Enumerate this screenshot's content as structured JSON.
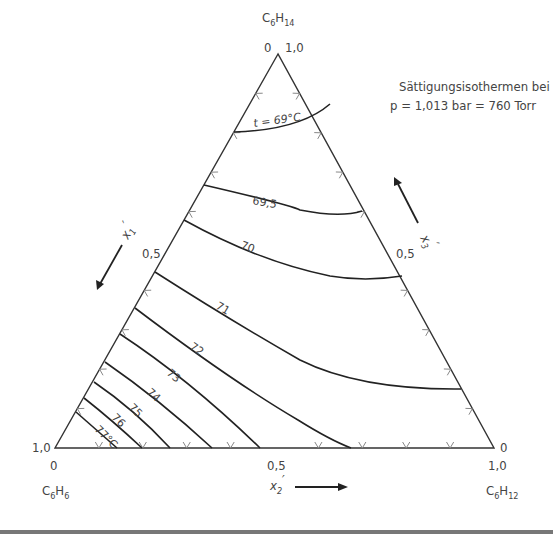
{
  "title": {
    "line1": "Sättigungsisothermen bei",
    "line2": "p = 1,013 bar = 760 Torr"
  },
  "components": {
    "top": {
      "base": "C",
      "sub1": "6",
      "mid": "H",
      "sub2": "14"
    },
    "left": {
      "base": "C",
      "sub1": "6",
      "mid": "H",
      "sub2": "6"
    },
    "right": {
      "base": "C",
      "sub1": "6",
      "mid": "H",
      "sub2": "12"
    }
  },
  "axes": {
    "x1": {
      "label": "x",
      "sub": "1",
      "prime": "′",
      "mid_tick": "0,5",
      "start": "0",
      "end": "1,0"
    },
    "x2": {
      "label": "x",
      "sub": "2",
      "prime": "′",
      "mid_tick": "0,5",
      "start": "0",
      "end": "1,0"
    },
    "x3": {
      "label": "x",
      "sub": "3",
      "prime": "′",
      "mid_tick": "0,5",
      "start": "0",
      "end": "1,0"
    }
  },
  "vertex_labels": {
    "top_left": "0",
    "top_right": "1,0",
    "bottom_left_side": "1,0",
    "bottom_left_below": "0",
    "bottom_mid": "0,5",
    "bottom_right_side": "0",
    "bottom_right_below": "1,0",
    "left_mid": "0,5",
    "right_mid": "0,5"
  },
  "isotherm_labels": {
    "t69": "t = 69°C",
    "t69_5": "69,5",
    "t70": "70",
    "t71": "71",
    "t72": "72",
    "t73": "73",
    "t74": "74",
    "t75": "75",
    "t76": "76",
    "t77": "77°C"
  },
  "chart_data": {
    "type": "ternary",
    "title": "Sättigungsisothermen bei p = 1,013 bar = 760 Torr",
    "vertices": {
      "top": "C6H14",
      "bottom_left": "C6H6",
      "bottom_right": "C6H12"
    },
    "axes": [
      "x1′ (C6H14)",
      "x2′ (C6H12)",
      "x3′"
    ],
    "tick_step": 0.1,
    "isotherms_celsius": [
      69,
      69.5,
      70,
      71,
      72,
      73,
      74,
      75,
      76,
      77
    ]
  }
}
